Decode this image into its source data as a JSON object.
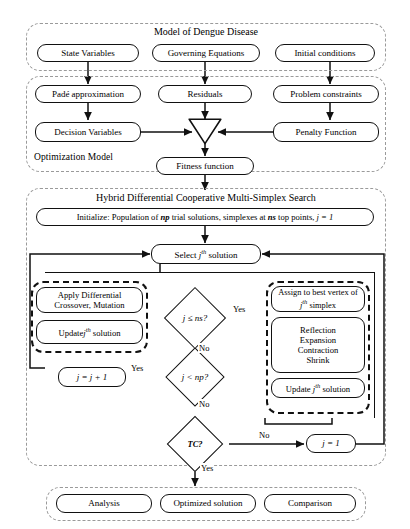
{
  "diagram": {
    "type": "flowchart",
    "groups": {
      "model": {
        "title": "Model of Dengue Disease"
      },
      "optimization": {
        "title": "Optimization Model"
      },
      "hybrid": {
        "title": "Hybrid Differential Cooperative Multi-Simplex Search"
      },
      "results": {
        "title": ""
      }
    },
    "model_boxes": [
      {
        "label": "State Variables"
      },
      {
        "label": "Governing Equations"
      },
      {
        "label": "Initial conditions"
      }
    ],
    "optimization_boxes": [
      {
        "label": "Padé approximation"
      },
      {
        "label": "Residuals"
      },
      {
        "label": "Problem constraints"
      },
      {
        "label": "Decision Variables"
      },
      {
        "label": "Penalty Function"
      },
      {
        "label": "Fitness function"
      }
    ],
    "combiner": {
      "label": "summation-triangle"
    },
    "hybrid": {
      "initialize": {
        "prefix": "Initialize: Population of ",
        "np": "np",
        "mid": " trial solutions, simplexes at ",
        "ns": "ns",
        "suffix": " top points, ",
        "assign": "j = 1"
      },
      "select": {
        "pre": "Select ",
        "var": "j",
        "sup": "th",
        "post": " solution"
      },
      "left_group": {
        "boxes": [
          {
            "line1": "Apply Differential",
            "line2": "Crossover, Mutation"
          },
          {
            "pre": "Update",
            "var": "j",
            "sup": "th",
            "post": " solution"
          }
        ]
      },
      "right_group": {
        "boxes": [
          {
            "line1": "Assign to best vertex of",
            "var": "j",
            "sup": "th",
            "line2_post": " simplex"
          },
          {
            "lines": [
              "Reflection",
              "Expansion",
              "Contraction",
              "Shrink"
            ]
          },
          {
            "pre": "Update ",
            "var": "j",
            "sup": "th",
            "post": " solution"
          }
        ]
      },
      "decisions": [
        {
          "label": "j ≤ ns?",
          "yes": "Yes",
          "no": "No"
        },
        {
          "label": "j < np?",
          "yes": "Yes",
          "no": "No"
        },
        {
          "label": "TC?",
          "yes": "Yes",
          "no": "No"
        }
      ],
      "increment_box": {
        "label": "j = j + 1"
      },
      "reset_box": {
        "label": "j = 1"
      }
    },
    "result_boxes": [
      {
        "label": "Analysis"
      },
      {
        "label": "Optimized solution"
      },
      {
        "label": "Comparison"
      }
    ],
    "colors": {
      "stroke": "#111111",
      "dashed_group": "#9a9a9a",
      "background": "#ffffff"
    }
  }
}
